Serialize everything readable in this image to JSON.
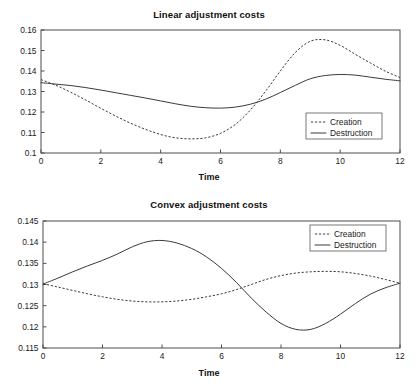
{
  "figure": {
    "width": 418,
    "height": 387,
    "background": "#ffffff",
    "line_color": "#3a3a3a",
    "axis_color": "#4c4c4c"
  },
  "charts": [
    {
      "id": "linear",
      "title": "Linear adjustment costs",
      "xlabel": "Time",
      "ylabel": "",
      "legend_position": "lower right",
      "legend": [
        "Creation",
        "Destruction"
      ]
    },
    {
      "id": "convex",
      "title": "Convex adjustment costs",
      "xlabel": "Time",
      "ylabel": "",
      "legend_position": "upper right",
      "legend": [
        "Creation",
        "Destruction"
      ]
    }
  ],
  "chart_data": [
    {
      "type": "line",
      "title": "Linear adjustment costs",
      "xlabel": "Time",
      "ylabel": "",
      "xlim": [
        0,
        12
      ],
      "ylim": [
        0.1,
        0.16
      ],
      "xticks": [
        0,
        2,
        4,
        6,
        8,
        10,
        12
      ],
      "yticks": [
        0.1,
        0.11,
        0.12,
        0.13,
        0.14,
        0.15,
        0.16
      ],
      "xticklabels": [
        "0",
        "2",
        "4",
        "6",
        "8",
        "10",
        "12"
      ],
      "yticklabels": [
        "0.1",
        "0.11",
        "0.12",
        "0.13",
        "0.14",
        "0.15",
        "0.16"
      ],
      "grid": false,
      "legend": [
        "Creation",
        "Destruction"
      ],
      "legend_position": "lower right",
      "x": [
        0,
        0.5,
        1,
        1.5,
        2,
        2.5,
        3,
        3.5,
        4,
        4.5,
        5,
        5.5,
        6,
        6.5,
        7,
        7.5,
        8,
        8.5,
        9,
        9.5,
        10,
        10.5,
        11,
        11.5,
        12
      ],
      "series": [
        {
          "name": "Creation",
          "style": "dashed",
          "values": [
            0.1358,
            0.133,
            0.1296,
            0.1258,
            0.1218,
            0.118,
            0.1145,
            0.1115,
            0.109,
            0.1074,
            0.1069,
            0.1074,
            0.1096,
            0.114,
            0.121,
            0.13,
            0.14,
            0.149,
            0.1545,
            0.1552,
            0.1525,
            0.1482,
            0.144,
            0.14,
            0.1368
          ]
        },
        {
          "name": "Destruction",
          "style": "solid",
          "values": [
            0.1343,
            0.1336,
            0.1329,
            0.1319,
            0.1307,
            0.1294,
            0.1281,
            0.1268,
            0.1254,
            0.124,
            0.1228,
            0.1221,
            0.1219,
            0.1224,
            0.1238,
            0.1262,
            0.1295,
            0.133,
            0.1362,
            0.1378,
            0.1383,
            0.138,
            0.137,
            0.136,
            0.1352
          ]
        }
      ]
    },
    {
      "type": "line",
      "title": "Convex adjustment costs",
      "xlabel": "Time",
      "ylabel": "",
      "xlim": [
        0,
        12
      ],
      "ylim": [
        0.115,
        0.145
      ],
      "xticks": [
        0,
        2,
        4,
        6,
        8,
        10,
        12
      ],
      "yticks": [
        0.115,
        0.12,
        0.125,
        0.13,
        0.135,
        0.14,
        0.145
      ],
      "xticklabels": [
        "0",
        "2",
        "4",
        "6",
        "8",
        "10",
        "12"
      ],
      "yticklabels": [
        "0.115",
        "0.12",
        "0.125",
        "0.13",
        "0.135",
        "0.14",
        "0.145"
      ],
      "grid": false,
      "legend": [
        "Creation",
        "Destruction"
      ],
      "legend_position": "upper right",
      "x": [
        0,
        0.5,
        1,
        1.5,
        2,
        2.5,
        3,
        3.5,
        4,
        4.5,
        5,
        5.5,
        6,
        6.5,
        7,
        7.5,
        8,
        8.5,
        9,
        9.5,
        10,
        10.5,
        11,
        11.5,
        12
      ],
      "series": [
        {
          "name": "Creation",
          "style": "dashed",
          "values": [
            0.1302,
            0.1294,
            0.1286,
            0.1278,
            0.1271,
            0.1265,
            0.1261,
            0.1259,
            0.1259,
            0.1261,
            0.1265,
            0.1271,
            0.1278,
            0.1288,
            0.13,
            0.1312,
            0.1321,
            0.1327,
            0.133,
            0.1331,
            0.133,
            0.1326,
            0.132,
            0.1312,
            0.1303
          ]
        },
        {
          "name": "Destruction",
          "style": "solid",
          "values": [
            0.1301,
            0.1315,
            0.133,
            0.1344,
            0.1357,
            0.1372,
            0.1389,
            0.1401,
            0.1404,
            0.1398,
            0.1385,
            0.1365,
            0.1338,
            0.1305,
            0.1268,
            0.1235,
            0.1208,
            0.1194,
            0.1194,
            0.1208,
            0.123,
            0.1255,
            0.1277,
            0.1292,
            0.1303
          ]
        }
      ]
    }
  ]
}
